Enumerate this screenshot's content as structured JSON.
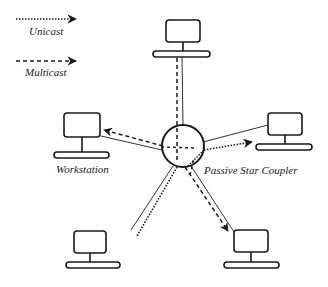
{
  "diagram": {
    "type": "star-network",
    "legend": {
      "items": [
        {
          "id": "unicast",
          "label": "Unicast",
          "line_style": "dotted"
        },
        {
          "id": "multicast",
          "label": "Multicast",
          "line_style": "dashed"
        }
      ]
    },
    "center_node": {
      "label": "Passive Star Coupler",
      "shape": "circle"
    },
    "nodes": [
      {
        "id": "top",
        "type": "workstation"
      },
      {
        "id": "left",
        "type": "workstation",
        "label": "Workstation"
      },
      {
        "id": "right",
        "type": "workstation"
      },
      {
        "id": "bottom-left",
        "type": "workstation"
      },
      {
        "id": "bottom-right",
        "type": "workstation"
      }
    ],
    "connections": [
      {
        "from": "coupler",
        "to": "top",
        "links": [
          "solid",
          "dashed"
        ]
      },
      {
        "from": "coupler",
        "to": "left",
        "links": [
          "solid",
          "dashed-arrow"
        ]
      },
      {
        "from": "coupler",
        "to": "right",
        "links": [
          "solid",
          "dotted-arrow"
        ]
      },
      {
        "from": "coupler",
        "to": "bottom-left",
        "links": [
          "solid",
          "dotted"
        ]
      },
      {
        "from": "coupler",
        "to": "bottom-right",
        "links": [
          "solid",
          "dashed-arrow"
        ]
      }
    ],
    "colors": {
      "stroke": "#1a1a1a",
      "background": "#ffffff"
    }
  }
}
